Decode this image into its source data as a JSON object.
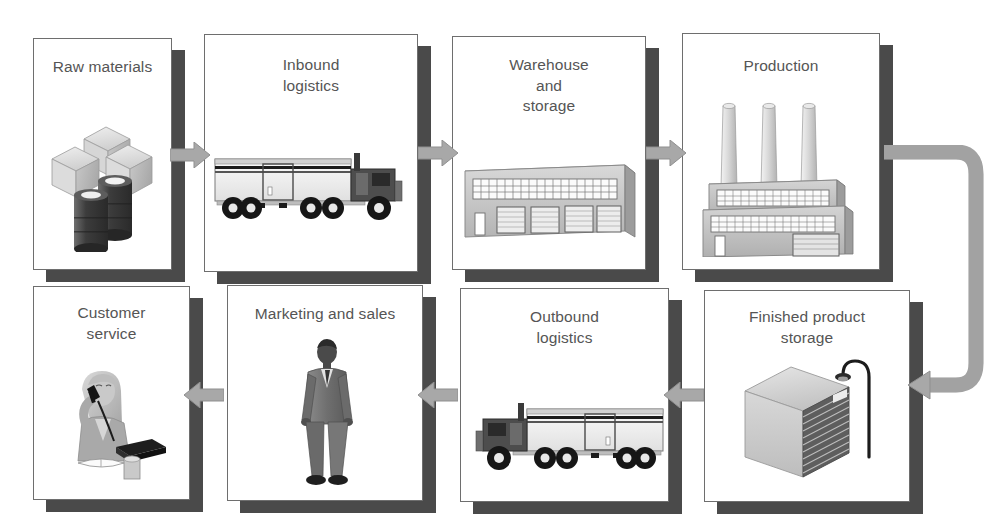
{
  "diagram": {
    "type": "process-flow",
    "background_color": "#ffffff",
    "box_border_color": "#6e6e6e",
    "box_shadow_color": "#4a4a4a",
    "title_text_color": "#555555",
    "arrow_color": "#a8a8a8",
    "arrow_edge_color": "#8f8f8f"
  },
  "rows": [
    {
      "name": "top-row",
      "direction": "left-to-right",
      "nodes": [
        {
          "id": "raw-materials",
          "label": "Raw materials",
          "label_lines": [
            "Raw materials"
          ],
          "illustration": "crates-and-barrels",
          "x": 33,
          "y": 38,
          "w": 139,
          "h": 232
        },
        {
          "id": "inbound-logistics",
          "label": "Inbound logistics",
          "label_lines": [
            "Inbound",
            "logistics"
          ],
          "illustration": "semi-truck-facing-right",
          "x": 204,
          "y": 34,
          "w": 214,
          "h": 238
        },
        {
          "id": "warehouse-and-storage",
          "label": "Warehouse and storage",
          "label_lines": [
            "Warehouse",
            "and",
            "storage"
          ],
          "illustration": "warehouse-building",
          "x": 452,
          "y": 36,
          "w": 194,
          "h": 234
        },
        {
          "id": "production",
          "label": "Production",
          "label_lines": [
            "Production"
          ],
          "illustration": "factory-with-smokestacks",
          "x": 682,
          "y": 33,
          "w": 198,
          "h": 237
        }
      ]
    },
    {
      "name": "bottom-row",
      "direction": "right-to-left",
      "nodes": [
        {
          "id": "customer-service",
          "label": "Customer service",
          "label_lines": [
            "Customer",
            "service"
          ],
          "illustration": "agent-on-phone",
          "x": 33,
          "y": 286,
          "w": 157,
          "h": 214
        },
        {
          "id": "marketing-and-sales",
          "label": "Marketing and sales",
          "label_lines": [
            "Marketing and sales"
          ],
          "illustration": "businessman-standing",
          "x": 227,
          "y": 285,
          "w": 196,
          "h": 216
        },
        {
          "id": "outbound-logistics",
          "label": "Outbound logistics",
          "label_lines": [
            "Outbound",
            "logistics"
          ],
          "illustration": "semi-truck-facing-left",
          "x": 460,
          "y": 288,
          "w": 209,
          "h": 214
        },
        {
          "id": "finished-product-storage",
          "label": "Finished product storage",
          "label_lines": [
            "Finished product",
            "storage"
          ],
          "illustration": "storage-crate-with-lamp",
          "x": 704,
          "y": 290,
          "w": 206,
          "h": 212
        }
      ]
    }
  ],
  "connectors": [
    {
      "id": "raw-to-inbound",
      "from": "raw-materials",
      "to": "inbound-logistics",
      "shape": "straight",
      "direction": "right"
    },
    {
      "id": "inbound-to-warehouse",
      "from": "inbound-logistics",
      "to": "warehouse-and-storage",
      "shape": "straight",
      "direction": "right"
    },
    {
      "id": "warehouse-to-production",
      "from": "warehouse-and-storage",
      "to": "production",
      "shape": "straight",
      "direction": "right"
    },
    {
      "id": "production-to-finished-storage",
      "from": "production",
      "to": "finished-product-storage",
      "shape": "u-turn",
      "direction": "down-then-left"
    },
    {
      "id": "finished-storage-to-outbound",
      "from": "finished-product-storage",
      "to": "outbound-logistics",
      "shape": "straight",
      "direction": "left"
    },
    {
      "id": "outbound-to-marketing",
      "from": "outbound-logistics",
      "to": "marketing-and-sales",
      "shape": "straight",
      "direction": "left"
    },
    {
      "id": "marketing-to-customer-service",
      "from": "marketing-and-sales",
      "to": "customer-service",
      "shape": "straight",
      "direction": "left"
    }
  ]
}
